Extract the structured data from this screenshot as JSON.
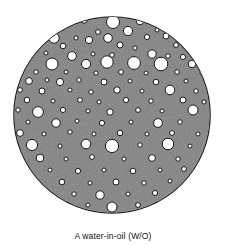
{
  "figure": {
    "top_caption": "emulsion",
    "bottom_caption": "A water-in-oil (W/O)",
    "colors": {
      "continuous_phase_fill": "#808080",
      "droplet_fill": "#ffffff",
      "outline": "#1a1a1a",
      "page_background": "#ffffff",
      "caption_text": "#111111"
    },
    "diagram": {
      "type": "emulsion-schematic",
      "outer_circle": {
        "cx": 112,
        "cy": 115,
        "r": 98,
        "label": "oil-continuous-phase"
      },
      "droplet_label": "water-droplet",
      "droplet_count": 104,
      "droplets": [
        {
          "cx": 113,
          "cy": 22,
          "r": 6.5
        },
        {
          "cx": 84,
          "cy": 20,
          "r": 3.2
        },
        {
          "cx": 140,
          "cy": 21,
          "r": 3.8
        },
        {
          "cx": 63,
          "cy": 28,
          "r": 2.2
        },
        {
          "cx": 98,
          "cy": 32,
          "r": 2.4
        },
        {
          "cx": 128,
          "cy": 31,
          "r": 4.6
        },
        {
          "cx": 157,
          "cy": 30,
          "r": 2.0
        },
        {
          "cx": 54,
          "cy": 38,
          "r": 5.2
        },
        {
          "cx": 76,
          "cy": 38,
          "r": 2.0
        },
        {
          "cx": 89,
          "cy": 40,
          "r": 3.6
        },
        {
          "cx": 108,
          "cy": 38,
          "r": 4.3
        },
        {
          "cx": 147,
          "cy": 37,
          "r": 2.6
        },
        {
          "cx": 166,
          "cy": 36,
          "r": 3.0
        },
        {
          "cx": 38,
          "cy": 45,
          "r": 2.0
        },
        {
          "cx": 63,
          "cy": 46,
          "r": 2.8
        },
        {
          "cx": 120,
          "cy": 45,
          "r": 3.0
        },
        {
          "cx": 135,
          "cy": 48,
          "r": 2.1
        },
        {
          "cx": 176,
          "cy": 45,
          "r": 2.4
        },
        {
          "cx": 190,
          "cy": 47,
          "r": 2.2
        },
        {
          "cx": 30,
          "cy": 54,
          "r": 2.3
        },
        {
          "cx": 46,
          "cy": 53,
          "r": 2.0
        },
        {
          "cx": 72,
          "cy": 56,
          "r": 4.4
        },
        {
          "cx": 93,
          "cy": 54,
          "r": 2.0
        },
        {
          "cx": 112,
          "cy": 55,
          "r": 2.3
        },
        {
          "cx": 152,
          "cy": 54,
          "r": 4.2
        },
        {
          "cx": 168,
          "cy": 56,
          "r": 2.2
        },
        {
          "cx": 183,
          "cy": 57,
          "r": 2.6
        },
        {
          "cx": 24,
          "cy": 63,
          "r": 2.0
        },
        {
          "cx": 52,
          "cy": 64,
          "r": 6.0
        },
        {
          "cx": 86,
          "cy": 64,
          "r": 4.6
        },
        {
          "cx": 107,
          "cy": 62,
          "r": 6.2
        },
        {
          "cx": 134,
          "cy": 63,
          "r": 6.4
        },
        {
          "cx": 161,
          "cy": 64,
          "r": 6.8
        },
        {
          "cx": 192,
          "cy": 64,
          "r": 3.8
        },
        {
          "cx": 36,
          "cy": 72,
          "r": 2.2
        },
        {
          "cx": 66,
          "cy": 72,
          "r": 2.0
        },
        {
          "cx": 96,
          "cy": 73,
          "r": 2.1
        },
        {
          "cx": 121,
          "cy": 72,
          "r": 2.4
        },
        {
          "cx": 146,
          "cy": 73,
          "r": 2.0
        },
        {
          "cx": 177,
          "cy": 72,
          "r": 2.3
        },
        {
          "cx": 202,
          "cy": 73,
          "r": 2.0
        },
        {
          "cx": 29,
          "cy": 81,
          "r": 3.4
        },
        {
          "cx": 47,
          "cy": 80,
          "r": 2.0
        },
        {
          "cx": 60,
          "cy": 82,
          "r": 3.6
        },
        {
          "cx": 79,
          "cy": 80,
          "r": 2.2
        },
        {
          "cx": 104,
          "cy": 82,
          "r": 3.0
        },
        {
          "cx": 130,
          "cy": 81,
          "r": 2.0
        },
        {
          "cx": 156,
          "cy": 82,
          "r": 2.8
        },
        {
          "cx": 186,
          "cy": 81,
          "r": 2.0
        },
        {
          "cx": 20,
          "cy": 90,
          "r": 2.4
        },
        {
          "cx": 42,
          "cy": 91,
          "r": 3.0
        },
        {
          "cx": 70,
          "cy": 90,
          "r": 2.0
        },
        {
          "cx": 91,
          "cy": 92,
          "r": 2.2
        },
        {
          "cx": 117,
          "cy": 90,
          "r": 3.2
        },
        {
          "cx": 142,
          "cy": 91,
          "r": 2.0
        },
        {
          "cx": 170,
          "cy": 90,
          "r": 4.8
        },
        {
          "cx": 196,
          "cy": 91,
          "r": 2.2
        },
        {
          "cx": 27,
          "cy": 100,
          "r": 2.8
        },
        {
          "cx": 53,
          "cy": 101,
          "r": 2.0
        },
        {
          "cx": 80,
          "cy": 100,
          "r": 2.4
        },
        {
          "cx": 99,
          "cy": 102,
          "r": 2.0
        },
        {
          "cx": 126,
          "cy": 100,
          "r": 2.6
        },
        {
          "cx": 151,
          "cy": 101,
          "r": 2.2
        },
        {
          "cx": 183,
          "cy": 100,
          "r": 3.0
        },
        {
          "cx": 204,
          "cy": 102,
          "r": 2.0
        },
        {
          "cx": 18,
          "cy": 110,
          "r": 2.2
        },
        {
          "cx": 38,
          "cy": 112,
          "r": 5.4
        },
        {
          "cx": 63,
          "cy": 110,
          "r": 2.6
        },
        {
          "cx": 88,
          "cy": 111,
          "r": 2.0
        },
        {
          "cx": 110,
          "cy": 112,
          "r": 3.2
        },
        {
          "cx": 138,
          "cy": 110,
          "r": 2.4
        },
        {
          "cx": 162,
          "cy": 111,
          "r": 2.0
        },
        {
          "cx": 193,
          "cy": 110,
          "r": 5.0
        },
        {
          "cx": 28,
          "cy": 122,
          "r": 2.0
        },
        {
          "cx": 56,
          "cy": 123,
          "r": 4.2
        },
        {
          "cx": 77,
          "cy": 121,
          "r": 2.0
        },
        {
          "cx": 102,
          "cy": 123,
          "r": 2.6
        },
        {
          "cx": 131,
          "cy": 122,
          "r": 2.0
        },
        {
          "cx": 158,
          "cy": 123,
          "r": 4.4
        },
        {
          "cx": 180,
          "cy": 122,
          "r": 2.2
        },
        {
          "cx": 20,
          "cy": 133,
          "r": 3.4
        },
        {
          "cx": 44,
          "cy": 134,
          "r": 2.0
        },
        {
          "cx": 70,
          "cy": 132,
          "r": 2.2
        },
        {
          "cx": 94,
          "cy": 134,
          "r": 2.0
        },
        {
          "cx": 120,
          "cy": 133,
          "r": 2.8
        },
        {
          "cx": 147,
          "cy": 134,
          "r": 2.0
        },
        {
          "cx": 172,
          "cy": 133,
          "r": 2.4
        },
        {
          "cx": 198,
          "cy": 134,
          "r": 2.0
        },
        {
          "cx": 32,
          "cy": 145,
          "r": 5.6
        },
        {
          "cx": 60,
          "cy": 146,
          "r": 2.0
        },
        {
          "cx": 86,
          "cy": 144,
          "r": 4.8
        },
        {
          "cx": 112,
          "cy": 146,
          "r": 6.6
        },
        {
          "cx": 140,
          "cy": 145,
          "r": 2.2
        },
        {
          "cx": 168,
          "cy": 144,
          "r": 5.8
        },
        {
          "cx": 190,
          "cy": 146,
          "r": 2.0
        },
        {
          "cx": 40,
          "cy": 158,
          "r": 3.8
        },
        {
          "cx": 66,
          "cy": 159,
          "r": 2.0
        },
        {
          "cx": 92,
          "cy": 157,
          "r": 2.4
        },
        {
          "cx": 124,
          "cy": 159,
          "r": 2.0
        },
        {
          "cx": 152,
          "cy": 158,
          "r": 3.4
        },
        {
          "cx": 178,
          "cy": 159,
          "r": 2.2
        },
        {
          "cx": 50,
          "cy": 170,
          "r": 2.0
        },
        {
          "cx": 78,
          "cy": 171,
          "r": 2.6
        },
        {
          "cx": 104,
          "cy": 170,
          "r": 2.0
        },
        {
          "cx": 133,
          "cy": 171,
          "r": 2.8
        },
        {
          "cx": 160,
          "cy": 170,
          "r": 2.0
        },
        {
          "cx": 184,
          "cy": 169,
          "r": 2.4
        },
        {
          "cx": 62,
          "cy": 182,
          "r": 2.8
        },
        {
          "cx": 90,
          "cy": 183,
          "r": 2.0
        },
        {
          "cx": 116,
          "cy": 182,
          "r": 3.0
        },
        {
          "cx": 144,
          "cy": 183,
          "r": 2.2
        },
        {
          "cx": 170,
          "cy": 181,
          "r": 2.0
        },
        {
          "cx": 74,
          "cy": 194,
          "r": 2.2
        },
        {
          "cx": 100,
          "cy": 195,
          "r": 4.2
        },
        {
          "cx": 128,
          "cy": 194,
          "r": 2.0
        },
        {
          "cx": 155,
          "cy": 193,
          "r": 2.6
        },
        {
          "cx": 88,
          "cy": 205,
          "r": 2.0
        },
        {
          "cx": 112,
          "cy": 207,
          "r": 5.0
        },
        {
          "cx": 138,
          "cy": 205,
          "r": 2.4
        }
      ]
    }
  }
}
